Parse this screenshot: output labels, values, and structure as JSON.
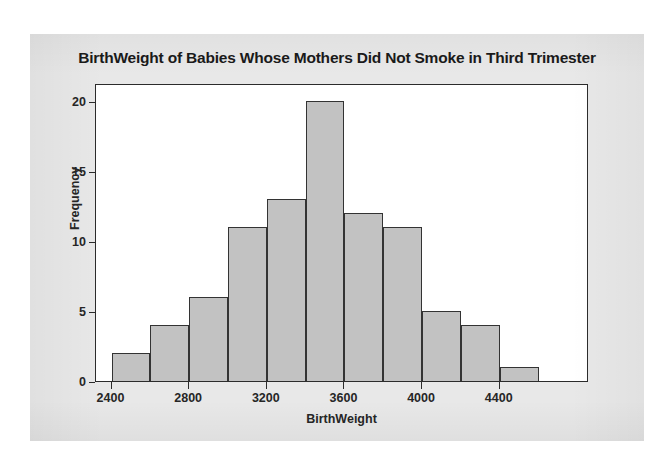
{
  "chart_data": {
    "type": "bar",
    "title": "BirthWeight of Babies Whose Mothers Did Not Smoke in Third Trimester",
    "xlabel": "BirthWeight",
    "ylabel": "Frequency",
    "bin_width": 200,
    "bin_edges": [
      2400,
      2600,
      2800,
      3000,
      3200,
      3400,
      3600,
      3800,
      4000,
      4200,
      4400,
      4600,
      4800
    ],
    "categories": [
      "2400-2600",
      "2600-2800",
      "2800-3000",
      "3000-3200",
      "3200-3400",
      "3400-3600",
      "3600-3800",
      "3800-4000",
      "4000-4200",
      "4200-4400",
      "4400-4600",
      "4600-4800"
    ],
    "values": [
      2,
      4,
      6,
      11,
      13,
      20,
      12,
      11,
      5,
      4,
      1,
      0
    ],
    "xlim": [
      2320,
      4860
    ],
    "ylim": [
      0,
      21.3
    ],
    "xticks": [
      2400,
      2800,
      3200,
      3600,
      4000,
      4400
    ],
    "xtick_labels": [
      "2400",
      "2800",
      "3200",
      "3600",
      "4000",
      "4400"
    ],
    "yticks": [
      0,
      5,
      10,
      15,
      20
    ],
    "ytick_labels": [
      "0",
      "5",
      "10",
      "15",
      "20"
    ],
    "grid": false,
    "legend": false,
    "bar_fill_color": "#c2c2c2",
    "bar_edge_color": "#333333",
    "plot_background": "#ffffff",
    "panel_background": "#e8e8e8"
  }
}
